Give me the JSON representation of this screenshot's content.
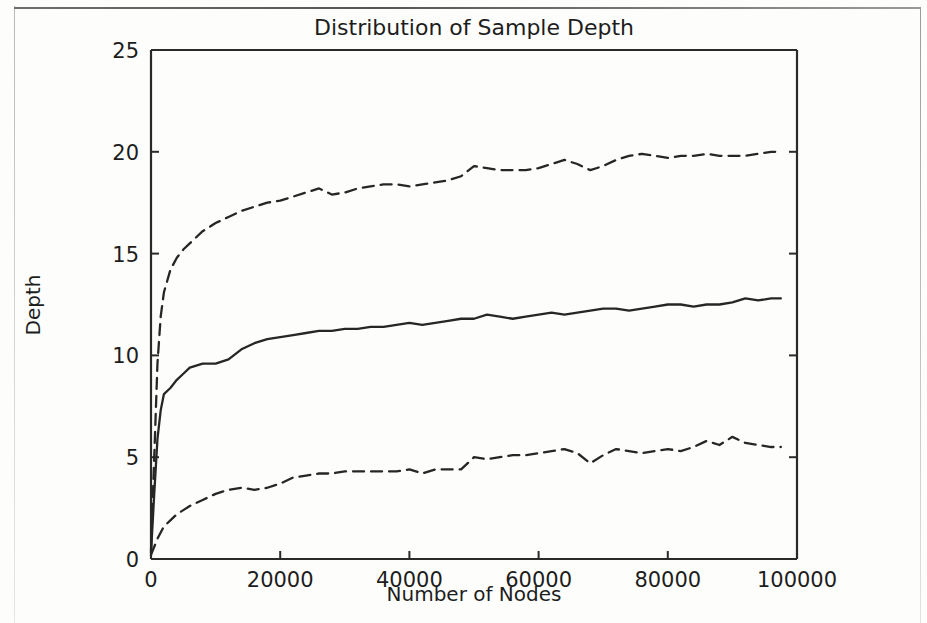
{
  "chart_data": {
    "type": "line",
    "title": "Distribution of Sample Depth",
    "xlabel": "Number of Nodes",
    "ylabel": "Depth",
    "xlim": [
      0,
      100000
    ],
    "ylim": [
      0,
      25
    ],
    "xticks": [
      0,
      20000,
      40000,
      60000,
      80000,
      100000
    ],
    "xticklabels": [
      "0",
      "20000",
      "40000",
      "60000",
      "80000",
      "100000"
    ],
    "yticks": [
      0,
      5,
      10,
      15,
      20,
      25
    ],
    "yticklabels": [
      "0",
      "5",
      "10",
      "15",
      "20",
      "25"
    ],
    "grid": false,
    "legend": "none",
    "x": [
      0,
      500,
      1000,
      1500,
      2000,
      3000,
      4000,
      5000,
      6000,
      8000,
      10000,
      12000,
      14000,
      16000,
      18000,
      20000,
      22000,
      24000,
      26000,
      28000,
      30000,
      32000,
      34000,
      36000,
      38000,
      40000,
      42000,
      44000,
      46000,
      48000,
      50000,
      52000,
      54000,
      56000,
      58000,
      60000,
      62000,
      64000,
      66000,
      68000,
      70000,
      72000,
      74000,
      76000,
      78000,
      80000,
      82000,
      84000,
      86000,
      88000,
      90000,
      92000,
      94000,
      96000,
      97500
    ],
    "series": [
      {
        "name": "upper",
        "style": "dashed",
        "color": "#262626",
        "values": [
          0.4,
          5.0,
          9.6,
          11.9,
          13.1,
          14.2,
          14.8,
          15.2,
          15.5,
          16.1,
          16.5,
          16.8,
          17.1,
          17.3,
          17.5,
          17.6,
          17.8,
          18.0,
          18.2,
          17.9,
          18.0,
          18.2,
          18.3,
          18.4,
          18.4,
          18.3,
          18.4,
          18.5,
          18.6,
          18.8,
          19.3,
          19.2,
          19.1,
          19.1,
          19.1,
          19.2,
          19.4,
          19.6,
          19.4,
          19.1,
          19.3,
          19.6,
          19.8,
          19.9,
          19.8,
          19.7,
          19.8,
          19.8,
          19.9,
          19.8,
          19.8,
          19.8,
          19.9,
          20.0,
          20.0
        ]
      },
      {
        "name": "median",
        "style": "solid",
        "color": "#262626",
        "values": [
          0.3,
          3.2,
          5.9,
          7.3,
          8.1,
          8.4,
          8.8,
          9.1,
          9.4,
          9.6,
          9.6,
          9.8,
          10.3,
          10.6,
          10.8,
          10.9,
          11.0,
          11.1,
          11.2,
          11.2,
          11.3,
          11.3,
          11.4,
          11.4,
          11.5,
          11.6,
          11.5,
          11.6,
          11.7,
          11.8,
          11.8,
          12.0,
          11.9,
          11.8,
          11.9,
          12.0,
          12.1,
          12.0,
          12.1,
          12.2,
          12.3,
          12.3,
          12.2,
          12.3,
          12.4,
          12.5,
          12.5,
          12.4,
          12.5,
          12.5,
          12.6,
          12.8,
          12.7,
          12.8,
          12.8
        ]
      },
      {
        "name": "lower",
        "style": "dashed",
        "color": "#262626",
        "values": [
          0.2,
          0.6,
          1.0,
          1.3,
          1.6,
          1.9,
          2.2,
          2.4,
          2.6,
          2.9,
          3.2,
          3.4,
          3.5,
          3.4,
          3.5,
          3.7,
          4.0,
          4.1,
          4.2,
          4.2,
          4.3,
          4.3,
          4.3,
          4.3,
          4.3,
          4.4,
          4.2,
          4.4,
          4.4,
          4.4,
          5.0,
          4.9,
          5.0,
          5.1,
          5.1,
          5.2,
          5.3,
          5.4,
          5.2,
          4.7,
          5.1,
          5.4,
          5.3,
          5.2,
          5.3,
          5.4,
          5.3,
          5.5,
          5.8,
          5.6,
          6.0,
          5.7,
          5.6,
          5.5,
          5.5
        ]
      }
    ]
  },
  "figure": {
    "caption_ghost": ""
  }
}
